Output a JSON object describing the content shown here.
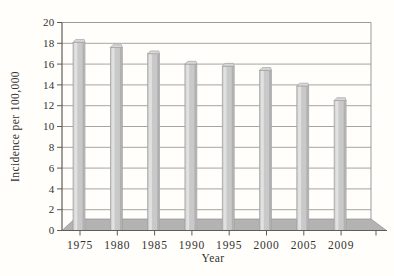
{
  "figure": {
    "kind": "scanned textbook chart",
    "background": "#fffefb"
  },
  "chart_data": {
    "type": "bar",
    "style": "3d-effect",
    "title": "",
    "xlabel": "Year",
    "ylabel": "Incidence per 100,000",
    "categories": [
      "1975",
      "1980",
      "1985",
      "1990",
      "1995",
      "2000",
      "2005",
      "2009"
    ],
    "values": [
      18.1,
      17.6,
      17.0,
      16.0,
      15.8,
      15.4,
      13.9,
      12.5
    ],
    "ylim": [
      0,
      20
    ],
    "ytick_step": 2,
    "ytick_labels": [
      "0",
      "2",
      "4",
      "6",
      "8",
      "10",
      "12",
      "14",
      "16",
      "18",
      "20"
    ],
    "grid": true,
    "legend": "none",
    "colors": {
      "bar_face": "#c9c9c9",
      "bar_highlight": "#e1e1e1",
      "bar_shade": "#b0b0b0",
      "bar_cap": "#d7d7d7",
      "bar_outline": "#9a9a9a",
      "floor": "#b3b3b3",
      "floor_outline": "#8f8f8f",
      "gridline": "#9b9b9b",
      "frame": "#9b9b9b",
      "axis": "#5f5d5c",
      "text": "#333130"
    }
  }
}
